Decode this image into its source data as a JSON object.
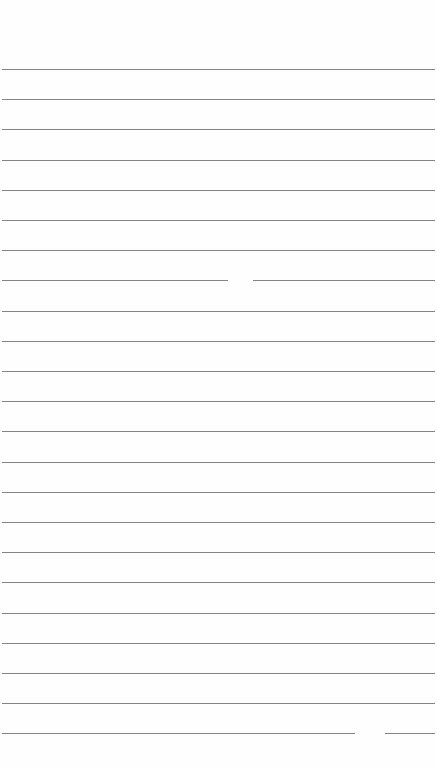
{
  "document": {
    "type": "lined-paper",
    "background_color": "#fefefe",
    "line_color": "#6e6e6e",
    "line_count": 23,
    "first_line_y": 69,
    "line_spacing": 30.2,
    "gaps": [
      {
        "line_index": 7,
        "x_start": 228,
        "x_end": 253
      },
      {
        "line_index": 22,
        "x_start": 355,
        "x_end": 385
      }
    ]
  }
}
